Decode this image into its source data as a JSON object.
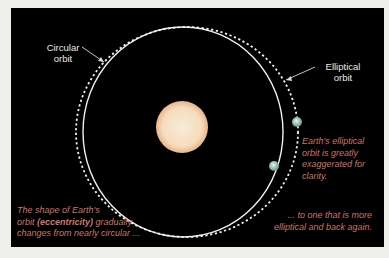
{
  "diagram": {
    "labels": {
      "circular_orbit": [
        "Circular",
        "orbit"
      ],
      "elliptical_orbit": [
        "Elliptical",
        "orbit"
      ]
    },
    "captions": {
      "left_pre": "The shape of Earth's",
      "left_line2_pre": "orbit ",
      "left_bold": "(eccentricity)",
      "left_line2_post": " gradually",
      "left_line3": "changes from nearly circular ...",
      "right_note": [
        "Earth's elliptical",
        "orbit is greatly",
        "exaggerated for",
        "clarity."
      ],
      "bottom_right": [
        "... to one that is more",
        "elliptical and back again."
      ]
    },
    "colors": {
      "background": "#000000",
      "page": "#efefeb",
      "orbit_line": "#f2f2f2",
      "sun": "#f6d9b8",
      "caption": "#c8786c",
      "earth": "#9fc8b8"
    }
  }
}
